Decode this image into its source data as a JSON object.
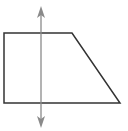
{
  "diagram": {
    "title": "",
    "shape": {
      "type": "right-trapezoid",
      "vertices": [
        [
          4,
          33
        ],
        [
          72,
          33
        ],
        [
          120,
          103
        ],
        [
          4,
          103
        ]
      ],
      "stroke": "#333333",
      "stroke_width": 1.5
    },
    "axis_line": {
      "type": "vertical-double-arrow",
      "x": 41,
      "y_top": 6,
      "y_bottom": 128,
      "stroke": "#8a8a8a",
      "stroke_width": 1.3,
      "arrowheads": [
        "arrow-up-icon",
        "arrow-down-icon"
      ]
    }
  }
}
